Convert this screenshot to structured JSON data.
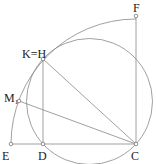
{
  "diagram": {
    "type": "geometric-construction",
    "points": [
      {
        "id": "E",
        "label": "E",
        "x": 11,
        "y": 144
      },
      {
        "id": "D",
        "label": "D",
        "x": 43,
        "y": 144
      },
      {
        "id": "C",
        "label": "C",
        "x": 136,
        "y": 144
      },
      {
        "id": "F",
        "label": "F",
        "x": 136,
        "y": 16
      },
      {
        "id": "KH",
        "label": "K=H",
        "x": 43,
        "y": 59
      },
      {
        "id": "M1",
        "label": "M",
        "label_sub": "1",
        "x": 19,
        "y": 101
      }
    ],
    "segments": [
      [
        "E",
        "C"
      ],
      [
        "C",
        "F"
      ],
      [
        "D",
        "KH"
      ],
      [
        "KH",
        "C"
      ],
      [
        "M1",
        "C"
      ]
    ],
    "arcs": [
      {
        "name": "large-quarter-arc",
        "center": "C",
        "radius": 125,
        "from": "E",
        "to": "F"
      },
      {
        "name": "small-circle",
        "cx": 89.5,
        "cy": 101.5,
        "r": 63
      }
    ],
    "colors": {
      "stroke": "#888888",
      "text": "#222222",
      "point_fill": "#ffffff"
    }
  }
}
